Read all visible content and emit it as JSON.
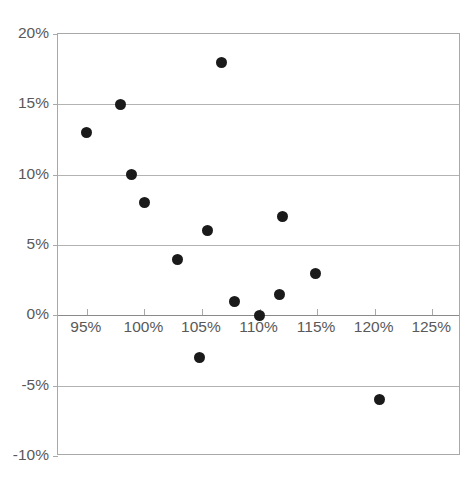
{
  "chart_data": {
    "type": "scatter",
    "title": "",
    "subtitle": "",
    "xlabel": "",
    "ylabel": "",
    "grid": true,
    "legend": null,
    "xlim": [
      92.5,
      127.5
    ],
    "ylim": [
      -10,
      20
    ],
    "x_tick_labels": [
      "95%",
      "100%",
      "105%",
      "110%",
      "115%",
      "120%",
      "125%"
    ],
    "x_ticks": [
      95,
      100,
      105,
      110,
      115,
      120,
      125
    ],
    "y_tick_labels": [
      "20%",
      "15%",
      "10%",
      "5%",
      "0%",
      "-5%",
      "-10%"
    ],
    "y_ticks": [
      20,
      15,
      10,
      5,
      0,
      -5,
      -10
    ],
    "point_color": "#1a1a1a",
    "grid_color": "#b3b3b3",
    "axis_color": "#a9a9a9",
    "text_color": "#595959",
    "points": [
      {
        "x": 95.0,
        "y": 13.0
      },
      {
        "x": 97.9,
        "y": 15.0
      },
      {
        "x": 98.9,
        "y": 10.0
      },
      {
        "x": 100.0,
        "y": 8.0
      },
      {
        "x": 102.9,
        "y": 4.0
      },
      {
        "x": 104.8,
        "y": -3.0
      },
      {
        "x": 105.5,
        "y": 6.0
      },
      {
        "x": 106.7,
        "y": 18.0
      },
      {
        "x": 107.8,
        "y": 1.0
      },
      {
        "x": 110.0,
        "y": 0.0
      },
      {
        "x": 111.7,
        "y": 1.5
      },
      {
        "x": 112.0,
        "y": 7.0
      },
      {
        "x": 114.9,
        "y": 3.0
      },
      {
        "x": 120.4,
        "y": -6.0
      }
    ]
  }
}
